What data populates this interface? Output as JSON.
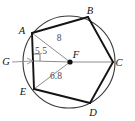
{
  "figure": {
    "kind": "circle-with-inscribed-pentagon",
    "colors": {
      "circle_stroke": "#3a3a3a",
      "polygon_stroke": "#141414",
      "helper_stroke": "#8c8c8c",
      "label_text": "#111111",
      "measure_text": "#4a4a4a",
      "background": "#ffffff"
    }
  },
  "vertices": [
    {
      "id": "A",
      "label": "A",
      "x": 32,
      "y": 33,
      "label_x": 22,
      "label_y": 34
    },
    {
      "id": "B",
      "label": "B",
      "x": 88,
      "y": 17,
      "label_x": 90,
      "label_y": 14
    },
    {
      "id": "C",
      "label": "C",
      "x": 113,
      "y": 62,
      "label_x": 117,
      "label_y": 66
    },
    {
      "id": "D",
      "label": "D",
      "x": 90,
      "y": 103,
      "label_x": 92,
      "label_y": 116
    },
    {
      "id": "E",
      "label": "E",
      "x": 34,
      "y": 89,
      "label_x": 22,
      "label_y": 95
    }
  ],
  "center": {
    "id": "F",
    "label": "F",
    "x": 70,
    "y": 62,
    "label_x": 72,
    "label_y": 58
  },
  "circle": {
    "cx": 69,
    "cy": 62,
    "r": 46
  },
  "point_g": {
    "id": "G",
    "label": "G",
    "label_x": 3,
    "label_y": 65,
    "arrow_from_x": 12,
    "arrow_from_y": 62,
    "arrow_to_x": 33,
    "arrow_to_y": 61
  },
  "measures": [
    {
      "id": "side-AB",
      "value": "8",
      "describes": "side AB length",
      "x": 59,
      "y": 41
    },
    {
      "id": "apothem-FG",
      "value": "5.5",
      "describes": "apothem from F to side AE",
      "x": 34,
      "y": 54
    },
    {
      "id": "radius-FE",
      "value": "6.8",
      "describes": "radius from F to vertex E",
      "x": 51,
      "y": 79
    }
  ],
  "segments": {
    "polygon_sides": [
      {
        "id": "AB",
        "from": "A",
        "to": "B"
      },
      {
        "id": "BC",
        "from": "B",
        "to": "C"
      },
      {
        "id": "CD",
        "from": "C",
        "to": "D"
      },
      {
        "id": "DE",
        "from": "D",
        "to": "E"
      },
      {
        "id": "EA",
        "from": "E",
        "to": "A"
      }
    ],
    "helper_lines": [
      {
        "id": "FA",
        "from": "F",
        "to": "A",
        "kind": "radius"
      },
      {
        "id": "FC",
        "from": "F",
        "to": "C",
        "kind": "radius"
      },
      {
        "id": "FE",
        "from": "F",
        "to": "E",
        "kind": "radius"
      },
      {
        "id": "FG",
        "from": "F",
        "to": "G",
        "kind": "apothem"
      }
    ]
  },
  "right_angle": {
    "at_x": 33,
    "at_y": 61,
    "size": 7
  }
}
